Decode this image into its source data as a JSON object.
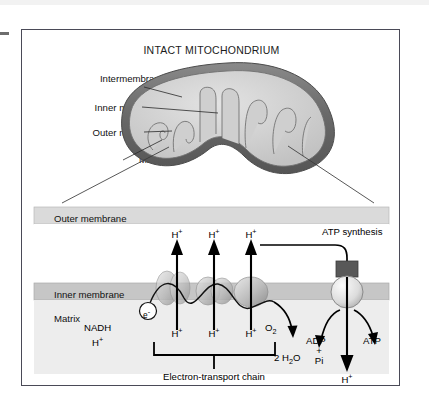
{
  "figure": {
    "title": "INTACT MITOCHONDRIUM",
    "callouts": {
      "intermembrane_space": "Intermembrane\nspace",
      "intermembrane_space_line1": "Intermembrane",
      "intermembrane_space_line2": "space",
      "inner_membrane": "Inner membrane",
      "outer_membrane": "Outer membrane",
      "matrix": "Matrix"
    }
  },
  "lower_panel": {
    "outer_membrane_label": "Outer membrane",
    "inner_membrane_label": "Inner membrane",
    "matrix_label": "Matrix",
    "atp_synthesis_label": "ATP synthesis",
    "chain_label": "Electron-transport chain",
    "electron_label": "e",
    "electron_charge": "-",
    "proton_label": "H",
    "proton_charge": "+",
    "protons_out": [
      "H",
      "H",
      "H"
    ],
    "protons_in": [
      "H",
      "H",
      "H"
    ],
    "nadh_label": "NADH",
    "nadh_proton": "H",
    "oxygen_label": "O",
    "oxygen_sub": "2",
    "water_prefix": "2 H",
    "water_sub": "2",
    "water_suffix": "O",
    "adp_label": "ADP",
    "adp_plus": "+",
    "pi_label": "Pi",
    "atp_label": "ATP",
    "proton_return": "H"
  },
  "colors": {
    "frame_border": "#4a4a57",
    "outer_membrane_dark": "#6f6f6f",
    "intermembrane_fill": "#d8d8d8",
    "matrix_fill": "#c9c9c9",
    "cristae_fill": "#d2d2d2",
    "band_outer": "#d9d9d9",
    "band_inner": "#c4c4c4",
    "matrix_bg": "#ededed",
    "complex_fill": "#b4b4b4",
    "atp_stalk": "#5a5a5a",
    "arrow": "#000000",
    "text": "#111111",
    "page_bg": "#ffffff"
  }
}
